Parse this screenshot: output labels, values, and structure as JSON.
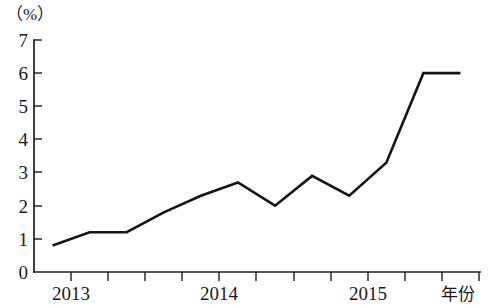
{
  "chart_data": {
    "type": "line",
    "title": "",
    "subtitle": "",
    "xlabel": "年份",
    "ylabel": "（%）",
    "ylim": [
      0,
      7
    ],
    "xlim": [
      0,
      12
    ],
    "grid": false,
    "legend": null,
    "y_ticks": [
      "0",
      "1",
      "2",
      "3",
      "4",
      "5",
      "6",
      "7"
    ],
    "y_tick_values": [
      0,
      1,
      2,
      3,
      4,
      5,
      6,
      7
    ],
    "x_tick_labels": [
      "2013",
      "2014",
      "2015"
    ],
    "x_tick_label_positions": [
      1,
      5,
      9
    ],
    "x_tick_count": 13,
    "x": [
      0.5,
      1.5,
      2.5,
      3.5,
      4.5,
      5.5,
      6.5,
      7.5,
      8.5,
      9.5,
      10.5,
      11.5
    ],
    "series": [
      {
        "name": "比率",
        "values": [
          0.8,
          1.2,
          1.2,
          1.8,
          2.3,
          2.7,
          2.0,
          2.9,
          2.3,
          3.3,
          6.0,
          6.0
        ],
        "color": "#161616"
      }
    ]
  },
  "axis": {
    "y_unit_label": "（%）",
    "x_axis_name": "年份"
  },
  "ticks": {
    "y": [
      {
        "label": "7",
        "value": 7
      },
      {
        "label": "6",
        "value": 6
      },
      {
        "label": "5",
        "value": 5
      },
      {
        "label": "4",
        "value": 4
      },
      {
        "label": "3",
        "value": 3
      },
      {
        "label": "2",
        "value": 2
      },
      {
        "label": "1",
        "value": 1
      },
      {
        "label": "0",
        "value": 0
      }
    ],
    "x": [
      {
        "label": "2013"
      },
      {
        "label": "2014"
      },
      {
        "label": "2015"
      }
    ]
  },
  "labels": {
    "y7": "7",
    "y6": "6",
    "y5": "5",
    "y4": "4",
    "y3": "3",
    "y2": "2",
    "y1": "1",
    "y0": "0",
    "x2013": "2013",
    "x2014": "2014",
    "x2015": "2015",
    "unit": "（%）",
    "year": "年份"
  }
}
